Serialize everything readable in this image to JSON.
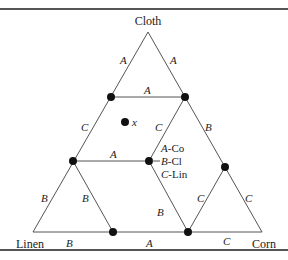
{
  "vertices": {
    "top": "Cloth",
    "left": "Linen",
    "right": "Corn"
  },
  "point_label": "x",
  "legend": [
    {
      "key": "A",
      "value": "Co"
    },
    {
      "key": "B",
      "value": "Cl"
    },
    {
      "key": "C",
      "value": "Lin"
    }
  ],
  "edge_labels": {
    "top_left": "A",
    "top_right": "A",
    "upper_horizontal": "A",
    "left_mid": "C",
    "inner_mid": "C",
    "right_mid": "B",
    "middle_horizontal": "A",
    "lower_left_outer": "B",
    "lower_left_inner": "B",
    "lower_center": "B",
    "lower_right_inner": "C",
    "lower_right_outer": "C",
    "bottom_left": "B",
    "bottom_center": "A",
    "bottom_right": "C"
  },
  "colors": {
    "line": "#555555",
    "dot": "#111111",
    "text": "#222222"
  }
}
